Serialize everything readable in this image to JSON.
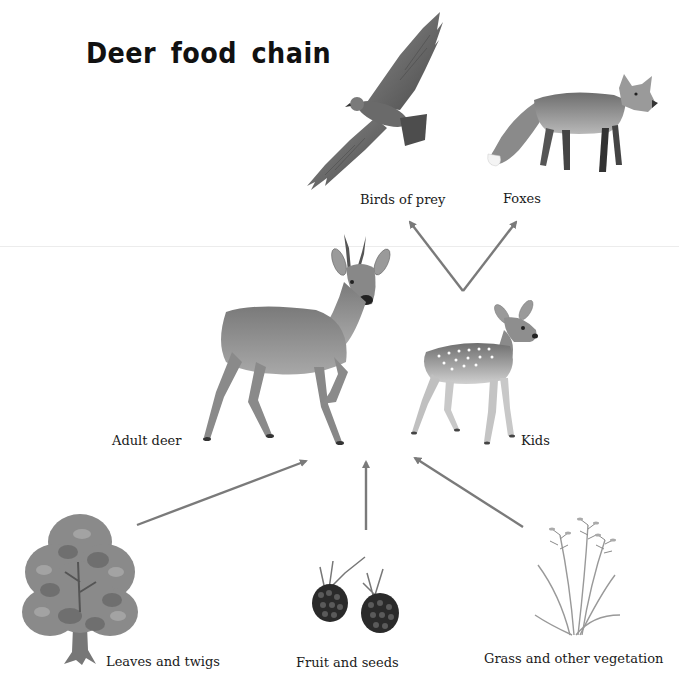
{
  "diagram": {
    "title": "Deer food chain",
    "colors": {
      "arrow": "#7a7a7a",
      "text": "#1a1a1a",
      "background": "#ffffff"
    },
    "nodes": {
      "birds_of_prey": {
        "label": "Birds of prey",
        "icon": "eagle-illustration",
        "level": "predator"
      },
      "foxes": {
        "label": "Foxes",
        "icon": "fox-illustration",
        "level": "predator"
      },
      "adult_deer": {
        "label": "Adult deer",
        "icon": "roe-deer-illustration",
        "level": "consumer"
      },
      "kids": {
        "label": "Kids",
        "icon": "fawn-illustration",
        "level": "consumer"
      },
      "leaves_and_twigs": {
        "label": "Leaves and twigs",
        "icon": "tree-illustration",
        "level": "food"
      },
      "fruit_and_seeds": {
        "label": "Fruit and seeds",
        "icon": "blackberries-illustration",
        "level": "food"
      },
      "grass": {
        "label": "Grass and other vegetation",
        "icon": "grass-illustration",
        "level": "food"
      }
    },
    "edges": [
      {
        "from": "leaves_and_twigs",
        "to": "deer"
      },
      {
        "from": "fruit_and_seeds",
        "to": "deer"
      },
      {
        "from": "grass",
        "to": "deer"
      },
      {
        "from": "kids",
        "to": "birds_of_prey"
      },
      {
        "from": "kids",
        "to": "foxes"
      }
    ]
  }
}
